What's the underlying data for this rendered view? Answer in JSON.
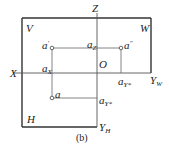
{
  "caption": "(b)",
  "planes": {
    "V": "V",
    "W": "W",
    "H": "H"
  },
  "axes": {
    "X": "X",
    "Z": "Z",
    "O": "O",
    "YW": {
      "base": "Y",
      "sub": "W"
    },
    "YH": {
      "base": "Y",
      "sub": "H"
    }
  },
  "points": {
    "a_prime": {
      "base": "a",
      "sup": "'"
    },
    "a_double_prime": {
      "base": "a",
      "sup": "\""
    },
    "a": {
      "base": "a"
    },
    "aX": {
      "base": "a",
      "sub": "X"
    },
    "aZ": {
      "base": "a",
      "sub": "Z"
    },
    "aYW": {
      "base": "a",
      "sub": "Y*"
    },
    "aYH": {
      "base": "a",
      "sub": "Y*"
    }
  },
  "colors": {
    "frame": "#333333",
    "projection_line": "#666666",
    "text": "#222222"
  }
}
